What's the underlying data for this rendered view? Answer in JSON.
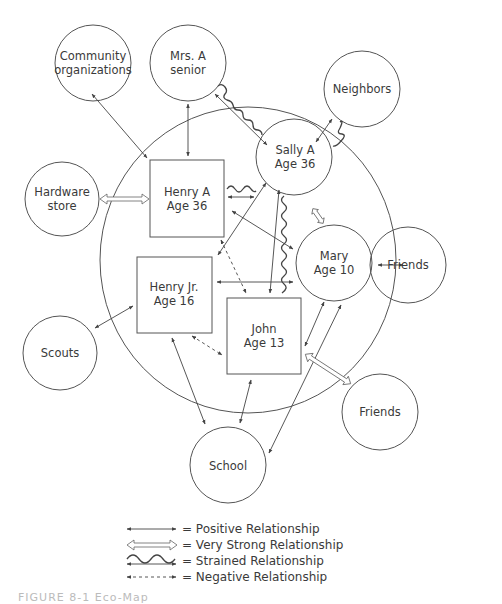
{
  "nodes": {
    "community": {
      "line1": "Community",
      "line2": "organizations"
    },
    "mrs_a": {
      "line1": "Mrs. A",
      "line2": "senior"
    },
    "neighbors": {
      "line1": "Neighbors"
    },
    "hardware": {
      "line1": "Hardware",
      "line2": "store"
    },
    "henry_a": {
      "line1": "Henry A",
      "line2": "Age 36"
    },
    "sally_a": {
      "line1": "Sally A",
      "line2": "Age 36"
    },
    "mary": {
      "line1": "Mary",
      "line2": "Age 10"
    },
    "friends_right": {
      "line1": "Friends"
    },
    "henry_jr": {
      "line1": "Henry Jr.",
      "line2": "Age 16"
    },
    "john": {
      "line1": "John",
      "line2": "Age 13"
    },
    "scouts": {
      "line1": "Scouts"
    },
    "friends_bottom": {
      "line1": "Friends"
    },
    "school": {
      "line1": "School"
    }
  },
  "legend": [
    {
      "symbol": "positive-arrow",
      "label": "= Positive Relationship"
    },
    {
      "symbol": "very-strong-arrow",
      "label": "= Very Strong Relationship"
    },
    {
      "symbol": "strained-arrow",
      "label": "= Strained Relationship"
    },
    {
      "symbol": "negative-arrow",
      "label": "= Negative Relationship"
    }
  ],
  "caption": "FIGURE 8-1   Eco-Map",
  "colors": {
    "line": "#444444",
    "background": "#ffffff"
  }
}
